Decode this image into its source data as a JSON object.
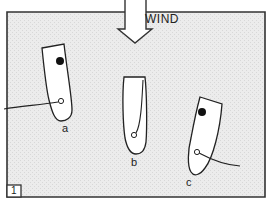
{
  "figure": {
    "number": "1",
    "wind_label": "WIND",
    "background": "#ebebeb",
    "border_color": "#333333",
    "boats": [
      {
        "id": "a",
        "label": "a",
        "has_crew_dot": true,
        "sheet_side": "left"
      },
      {
        "id": "b",
        "label": "b",
        "has_crew_dot": false,
        "sheet_side": "up"
      },
      {
        "id": "c",
        "label": "c",
        "has_crew_dot": true,
        "sheet_side": "right"
      }
    ]
  }
}
